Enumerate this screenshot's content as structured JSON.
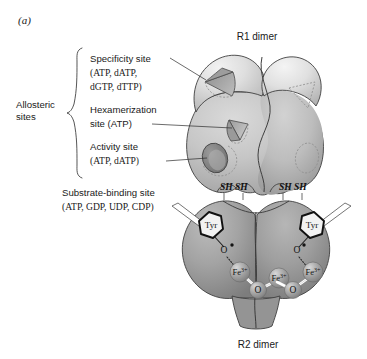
{
  "figure": {
    "panel_label": "(a)",
    "top_title": "R1 dimer",
    "bottom_title": "R2 dimer"
  },
  "allosteric": {
    "group_label_line1": "Allosteric",
    "group_label_line2": "sites",
    "sites": [
      {
        "name": "specificity-site",
        "line1": "Specificity site",
        "line2": "(ATP, dATP,",
        "line3": "dGTP, dTTP)"
      },
      {
        "name": "hexamerization-site",
        "line1": "Hexamerization",
        "line2": "site (ATP)"
      },
      {
        "name": "activity-site",
        "line1": "Activity site",
        "line2": "(ATP, dATP)"
      }
    ]
  },
  "substrate": {
    "line1": "Substrate-binding site",
    "line2": "(ATP, GDP, UDP, CDP)"
  },
  "thiols": {
    "left_label": "SH SH",
    "right_label": "SH SH"
  },
  "atoms": {
    "tyr_label": "Tyr",
    "oxygen_label": "O",
    "iron_label": "Fe",
    "iron_charge": "3+"
  },
  "colors": {
    "r1_light": "#e2e2e2",
    "r1_mid": "#c9c9c9",
    "r1_dark": "#a8a8a8",
    "r2_body": "#9b9b9b",
    "r2_shadow": "#7e7e7e",
    "pocket_dark": "#8a8a8a",
    "sphere": "#a0a0a0",
    "outline": "#3f3f3f",
    "text": "#1a1a1a"
  }
}
